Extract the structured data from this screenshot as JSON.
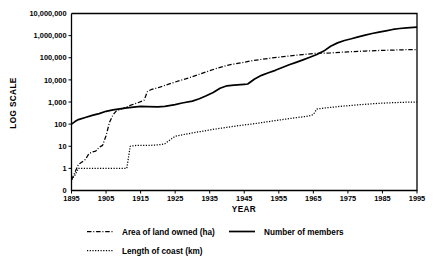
{
  "chart_data": {
    "type": "line",
    "title": "",
    "subtitle": "",
    "xlabel": "YEAR",
    "ylabel": "LOG  SCALE",
    "yscale": "log",
    "grid": false,
    "legend_position": "bottom-left",
    "xlim": [
      1895,
      1995
    ],
    "ylim": [
      0.1,
      10000000
    ],
    "x_ticks": [
      1895,
      1905,
      1915,
      1925,
      1935,
      1945,
      1955,
      1965,
      1975,
      1985,
      1995
    ],
    "x_tick_labels": [
      "1895",
      "1905",
      "1915",
      "1925",
      "1935",
      "1945",
      "1955",
      "1965",
      "1975",
      "1985",
      "1995"
    ],
    "y_ticks": [
      0,
      1,
      10,
      1000,
      10000,
      100000,
      1000000,
      10000000
    ],
    "y_tick_labels": [
      "0",
      "1",
      "10",
      "100",
      "1,000",
      "10,000",
      "100,000",
      "1,000,000",
      "10,000,000"
    ],
    "series": [
      {
        "name": "Area of land owned (ha)",
        "style": "dash-dot",
        "x": [
          1895,
          1897,
          1899,
          1900,
          1901,
          1902,
          1903,
          1904,
          1905,
          1906,
          1907,
          1908,
          1910,
          1912,
          1914,
          1916,
          1917,
          1918,
          1920,
          1922,
          1925,
          1928,
          1930,
          1932,
          1935,
          1937,
          1940,
          1942,
          1945,
          1947,
          1950,
          1953,
          1955,
          1957,
          1960,
          1962,
          1965,
          1967,
          1970,
          1973,
          1975,
          1978,
          1980,
          1983,
          1985,
          1988,
          1990,
          1993,
          1995
        ],
        "y": [
          0.3,
          1.5,
          2.5,
          4.5,
          5.5,
          6.0,
          9.0,
          11.0,
          30.0,
          120.0,
          260.0,
          400.0,
          520.0,
          700.0,
          900.0,
          1200.0,
          3000.0,
          3600.0,
          4400.0,
          5600.0,
          8000.0,
          11000.0,
          14000.0,
          18000.0,
          26000.0,
          33000.0,
          45000.0,
          52000.0,
          63000.0,
          72000.0,
          85000.0,
          98000.0,
          105000.0,
          115000.0,
          130000.0,
          140000.0,
          155000.0,
          160000.0,
          165000.0,
          178000.0,
          185000.0,
          195000.0,
          200000.0,
          210000.0,
          215000.0,
          222000.0,
          228000.0,
          232000.0,
          235000.0
        ]
      },
      {
        "name": "Number of members",
        "style": "solid",
        "x": [
          1895,
          1896,
          1897,
          1899,
          1901,
          1903,
          1905,
          1907,
          1909,
          1911,
          1913,
          1915,
          1917,
          1920,
          1922,
          1925,
          1927,
          1930,
          1932,
          1934,
          1936,
          1938,
          1940,
          1942,
          1944,
          1945,
          1946,
          1948,
          1950,
          1952,
          1954,
          1956,
          1958,
          1960,
          1962,
          1964,
          1966,
          1968,
          1970,
          1972,
          1974,
          1976,
          1978,
          1980,
          1982,
          1984,
          1986,
          1988,
          1990,
          1992,
          1995
        ],
        "y": [
          100,
          130,
          160,
          200,
          250,
          300,
          380,
          440,
          490,
          540,
          590,
          640,
          620,
          600,
          640,
          760,
          900,
          1100,
          1400,
          1900,
          2700,
          4200,
          5400,
          5800,
          6100,
          6300,
          6500,
          11000,
          16000,
          21000,
          27000,
          36000,
          48000,
          62000,
          80000,
          105000,
          140000,
          200000,
          330000,
          470000,
          600000,
          720000,
          880000,
          1050000,
          1250000,
          1450000,
          1650000,
          1900000,
          2100000,
          2250000,
          2400000
        ]
      },
      {
        "name": "Length of coast (km)",
        "style": "dotted",
        "x": [
          1895,
          1896,
          1897,
          1899,
          1905,
          1910,
          1911,
          1912,
          1914,
          1916,
          1918,
          1920,
          1921,
          1922,
          1924,
          1925,
          1927,
          1930,
          1933,
          1936,
          1940,
          1944,
          1948,
          1952,
          1956,
          1960,
          1963,
          1964,
          1965,
          1966,
          1968,
          1970,
          1973,
          1976,
          1980,
          1984,
          1988,
          1992,
          1995
        ],
        "y": [
          0.3,
          0.5,
          1.0,
          1.0,
          1.0,
          1.0,
          1.0,
          10.0,
          11.0,
          11.0,
          11.0,
          11.5,
          12.0,
          13.0,
          22.0,
          28.0,
          33.0,
          40.0,
          48.0,
          58.0,
          72.0,
          88.0,
          105.0,
          130.0,
          160.0,
          195.0,
          225.0,
          240.0,
          270.0,
          480.0,
          530.0,
          570.0,
          640.0,
          700.0,
          790.0,
          870.0,
          930.0,
          980.0,
          1000.0
        ]
      }
    ],
    "legend": [
      {
        "label": "Area of land owned (ha)",
        "style": "dash-dot",
        "row": 1,
        "col": 1
      },
      {
        "label": "Number of members",
        "style": "solid",
        "row": 1,
        "col": 2
      },
      {
        "label": "Length of coast (km)",
        "style": "dotted",
        "row": 2,
        "col": 1
      }
    ]
  },
  "colors": {
    "ink": "#000000",
    "background": "#ffffff"
  }
}
